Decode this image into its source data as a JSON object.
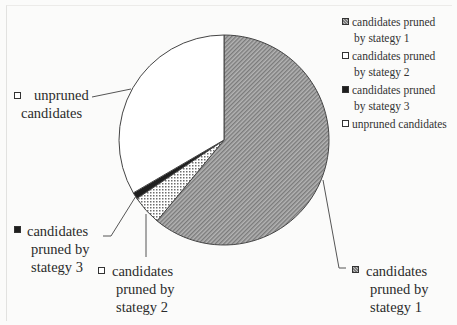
{
  "chart_data": {
    "type": "pie",
    "title": "",
    "start_angle_deg": 0,
    "direction": "clockwise",
    "center": [
      224,
      140
    ],
    "radius": 105,
    "slices": [
      {
        "key": "s1",
        "label": "candidates pruned by stategy 1",
        "value": 61,
        "fill": "#a6a6a6",
        "pattern": "diagonal-hatch"
      },
      {
        "key": "s2",
        "label": "candidates pruned by stategy 2",
        "value": 4.6,
        "fill": "#ffffff",
        "pattern": "crosshatch-dots"
      },
      {
        "key": "s3",
        "label": "candidates pruned by stategy 3",
        "value": 1.0,
        "fill": "#1e1e1e",
        "pattern": "solid"
      },
      {
        "key": "s4",
        "label": "unpruned candidates",
        "value": 33.4,
        "fill": "#ffffff",
        "pattern": "none"
      }
    ],
    "categories": [
      "candidates pruned by stategy 1",
      "candidates pruned by stategy 2",
      "candidates pruned by stategy 3",
      "unpruned candidates"
    ],
    "values": [
      61,
      4.6,
      1.0,
      33.4
    ],
    "legend_position": "top-right",
    "value_labels_shown": false
  },
  "legend": {
    "entries": [
      {
        "line1": "candidates pruned",
        "line2": "by stategy 1"
      },
      {
        "line1": "candidates pruned",
        "line2": "by stategy 2"
      },
      {
        "line1": "candidates pruned",
        "line2": "by stategy 3"
      },
      {
        "line1": "unpruned candidates",
        "line2": ""
      }
    ]
  },
  "callouts": {
    "s1": {
      "lines": [
        "candidates",
        "pruned by",
        "stategy 1"
      ]
    },
    "s2": {
      "lines": [
        "candidates",
        "pruned by",
        "stategy 2"
      ]
    },
    "s3": {
      "lines": [
        "candidates",
        "pruned by",
        "stategy 3"
      ]
    },
    "s4": {
      "lines": [
        "unpruned",
        "candidates"
      ]
    }
  }
}
